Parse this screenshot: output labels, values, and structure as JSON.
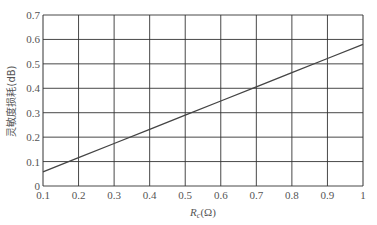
{
  "chart_data": {
    "type": "line",
    "title": "",
    "xlabel": "R_c(Ω)",
    "xlabel_main": "R",
    "xlabel_sub": "c",
    "xlabel_unit": "(Ω)",
    "ylabel": "灵敏度损耗(dB)",
    "xlim": [
      0.1,
      1.0
    ],
    "ylim": [
      0,
      0.7
    ],
    "xticks": [
      "0.1",
      "0.2",
      "0.3",
      "0.4",
      "0.5",
      "0.6",
      "0.7",
      "0.8",
      "0.9",
      "1"
    ],
    "yticks": [
      "0",
      "0.1",
      "0.2",
      "0.3",
      "0.4",
      "0.5",
      "0.6",
      "0.7"
    ],
    "grid": true,
    "legend": null,
    "series": [
      {
        "name": "sensitivity loss",
        "x": [
          0.1,
          0.2,
          0.3,
          0.4,
          0.5,
          0.6,
          0.7,
          0.8,
          0.9,
          1.0
        ],
        "values": [
          0.058,
          0.116,
          0.174,
          0.232,
          0.29,
          0.348,
          0.406,
          0.464,
          0.522,
          0.58
        ]
      }
    ]
  },
  "colors": {
    "grid": "#333333",
    "line": "#444444",
    "text": "#555555"
  }
}
